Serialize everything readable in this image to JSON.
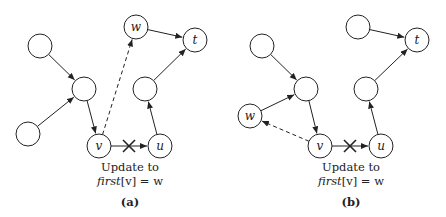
{
  "panels": [
    {
      "id": "a",
      "sublabel": "(a)",
      "caption_line1": "Update to",
      "caption_line2_func": "first",
      "caption_line2_rest": "[v] = w",
      "nodes": [
        {
          "id": "n1",
          "label": "",
          "x": 40,
          "y": 46
        },
        {
          "id": "n2",
          "label": "",
          "x": 84,
          "y": 89
        },
        {
          "id": "n3",
          "label": "",
          "x": 28,
          "y": 134
        },
        {
          "id": "w",
          "label": "w",
          "x": 136,
          "y": 27
        },
        {
          "id": "t",
          "label": "t",
          "x": 195,
          "y": 40
        },
        {
          "id": "n4",
          "label": "",
          "x": 145,
          "y": 89
        },
        {
          "id": "v",
          "label": "v",
          "x": 99,
          "y": 146
        },
        {
          "id": "u",
          "label": "u",
          "x": 160,
          "y": 146
        }
      ],
      "edges": [
        {
          "from": "n1",
          "to": "n2",
          "style": "solid"
        },
        {
          "from": "n3",
          "to": "n2",
          "style": "solid"
        },
        {
          "from": "n2",
          "to": "v",
          "style": "solid"
        },
        {
          "from": "w",
          "to": "t",
          "style": "solid"
        },
        {
          "from": "n4",
          "to": "t",
          "style": "solid"
        },
        {
          "from": "u",
          "to": "n4",
          "style": "solid"
        },
        {
          "from": "v",
          "to": "u",
          "style": "solid",
          "crossed": true
        },
        {
          "from": "v",
          "to": "w",
          "style": "dashed"
        }
      ]
    },
    {
      "id": "b",
      "sublabel": "(b)",
      "caption_line1": "Update to",
      "caption_line2_func": "first",
      "caption_line2_rest": "[v] = w",
      "nodes": [
        {
          "id": "n1",
          "label": "",
          "x": 262,
          "y": 46
        },
        {
          "id": "n2",
          "label": "",
          "x": 306,
          "y": 89
        },
        {
          "id": "w",
          "label": "w",
          "x": 250,
          "y": 116
        },
        {
          "id": "n5",
          "label": "",
          "x": 358,
          "y": 27
        },
        {
          "id": "t",
          "label": "t",
          "x": 417,
          "y": 40
        },
        {
          "id": "n4",
          "label": "",
          "x": 366,
          "y": 89
        },
        {
          "id": "v",
          "label": "v",
          "x": 320,
          "y": 146
        },
        {
          "id": "u",
          "label": "u",
          "x": 381,
          "y": 146
        }
      ],
      "edges": [
        {
          "from": "n1",
          "to": "n2",
          "style": "solid"
        },
        {
          "from": "w",
          "to": "n2",
          "style": "solid"
        },
        {
          "from": "n2",
          "to": "v",
          "style": "solid"
        },
        {
          "from": "n5",
          "to": "t",
          "style": "solid"
        },
        {
          "from": "n4",
          "to": "t",
          "style": "solid"
        },
        {
          "from": "u",
          "to": "n4",
          "style": "solid"
        },
        {
          "from": "v",
          "to": "u",
          "style": "solid",
          "crossed": true
        },
        {
          "from": "v",
          "to": "w",
          "style": "dashed"
        }
      ]
    }
  ]
}
